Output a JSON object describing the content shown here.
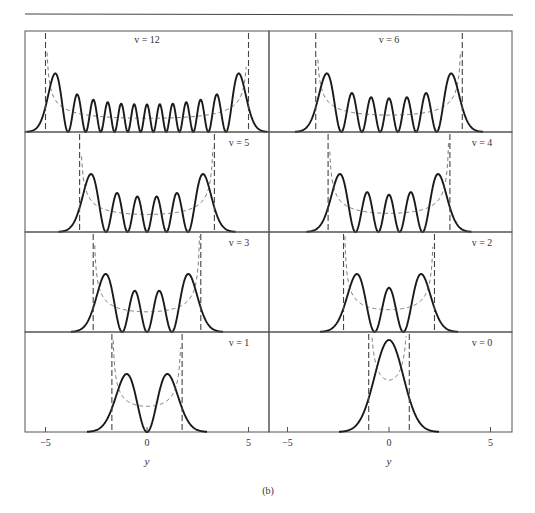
{
  "figure": {
    "caption_label": "(b)",
    "xlabel": "y",
    "x_ticks": [
      -5,
      0,
      5
    ],
    "x_tick_labels": [
      "−5",
      "0",
      "5"
    ]
  },
  "chart_data": {
    "type": "line",
    "xlabel": "y",
    "ylabel": "",
    "xlim": [
      -6,
      6
    ],
    "x_ticks": [
      -5,
      0,
      5
    ],
    "grid": false,
    "legend": "none",
    "layout": "4 rows × 2 columns of panels, shared x axis per column",
    "panels": [
      {
        "label": "v = 12",
        "v": 12,
        "row": 0,
        "col": 0,
        "turning_point": 5.0,
        "nodes": 12,
        "peaks": 13
      },
      {
        "label": "v = 6",
        "v": 6,
        "row": 0,
        "col": 1,
        "turning_point": 3.61,
        "nodes": 6,
        "peaks": 7
      },
      {
        "label": "v = 5",
        "v": 5,
        "row": 1,
        "col": 0,
        "turning_point": 3.32,
        "nodes": 5,
        "peaks": 6
      },
      {
        "label": "v = 4",
        "v": 4,
        "row": 1,
        "col": 1,
        "turning_point": 3.0,
        "nodes": 4,
        "peaks": 5
      },
      {
        "label": "v = 3",
        "v": 3,
        "row": 2,
        "col": 0,
        "turning_point": 2.65,
        "nodes": 3,
        "peaks": 4
      },
      {
        "label": "v = 2",
        "v": 2,
        "row": 2,
        "col": 1,
        "turning_point": 2.24,
        "nodes": 2,
        "peaks": 3
      },
      {
        "label": "v = 1",
        "v": 1,
        "row": 3,
        "col": 0,
        "turning_point": 1.73,
        "nodes": 1,
        "peaks": 2
      },
      {
        "label": "v = 0",
        "v": 0,
        "row": 3,
        "col": 1,
        "turning_point": 1.0,
        "nodes": 0,
        "peaks": 1
      }
    ],
    "series": [
      {
        "name": "quantum probability density |ψ_v|²",
        "style": "solid, thick"
      },
      {
        "name": "classical probability density",
        "style": "dashed, thin"
      },
      {
        "name": "classical turning points y = ±√(2v+1)",
        "style": "dashed vertical"
      }
    ]
  },
  "colors": {
    "curve": "#1a1a1a",
    "dashed": "#444444",
    "frame": "#555555",
    "background": "#ffffff"
  }
}
